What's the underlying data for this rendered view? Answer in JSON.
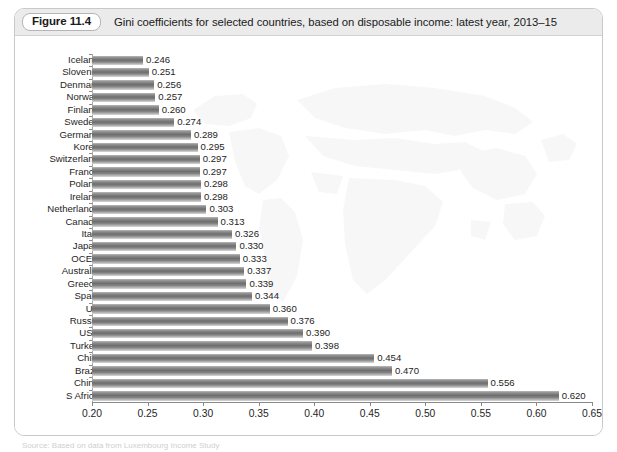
{
  "figure": {
    "number_label": "Figure 11.4",
    "caption": "Gini coefficients for selected countries, based on disposable income: latest year, 2013–15"
  },
  "source_note": "Source: Based on data from Luxembourg Income Study",
  "colors": {
    "header_background": "#ebebeb",
    "panel_border": "#c9c9c9",
    "bar_fill_dark": "#6e6e6e",
    "bar_fill_light": "#c5c5c5",
    "axis": "#8a8a8a",
    "text": "#1e1e1e",
    "watermark": "#f0f0f0"
  },
  "chart_data": {
    "type": "bar",
    "orientation": "horizontal",
    "title": "Gini coefficients for selected countries, based on disposable income: latest year, 2013–15",
    "xlabel": "",
    "ylabel": "",
    "xlim": [
      0.2,
      0.65
    ],
    "xticks": [
      "0.20",
      "0.25",
      "0.30",
      "0.35",
      "0.40",
      "0.45",
      "0.50",
      "0.55",
      "0.60",
      "0.65"
    ],
    "xtick_values": [
      0.2,
      0.25,
      0.3,
      0.35,
      0.4,
      0.45,
      0.5,
      0.55,
      0.6,
      0.65
    ],
    "grid": false,
    "legend": null,
    "data_labels": true,
    "categories": [
      "Iceland",
      "Slovenia",
      "Denmark",
      "Norway",
      "Finland",
      "Sweden",
      "Germany",
      "Korea",
      "Switzerland",
      "France",
      "Poland",
      "Ireland",
      "Netherlands",
      "Canada",
      "Italy",
      "Japan",
      "OCED",
      "Australia",
      "Greece",
      "Spain",
      "UK",
      "Russia",
      "USA",
      "Turkey",
      "Chile",
      "Brazil",
      "China",
      "S Africa"
    ],
    "values": [
      0.246,
      0.251,
      0.256,
      0.257,
      0.26,
      0.274,
      0.289,
      0.295,
      0.297,
      0.297,
      0.298,
      0.298,
      0.303,
      0.313,
      0.326,
      0.33,
      0.333,
      0.337,
      0.339,
      0.344,
      0.36,
      0.376,
      0.39,
      0.398,
      0.454,
      0.47,
      0.556,
      0.62
    ],
    "value_labels": [
      "0.246",
      "0.251",
      "0.256",
      "0.257",
      "0.260",
      "0.274",
      "0.289",
      "0.295",
      "0.297",
      "0.297",
      "0.298",
      "0.298",
      "0.303",
      "0.313",
      "0.326",
      "0.330",
      "0.333",
      "0.337",
      "0.339",
      "0.344",
      "0.360",
      "0.376",
      "0.390",
      "0.398",
      "0.454",
      "0.470",
      "0.556",
      "0.620"
    ]
  }
}
